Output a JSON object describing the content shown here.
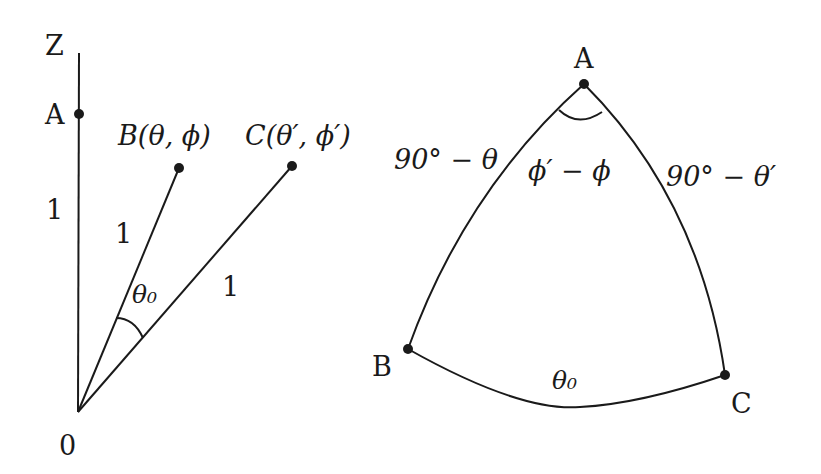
{
  "diagram": {
    "left": {
      "axis_label": "Z",
      "origin_label": "0",
      "point_a_label": "A",
      "point_b_label": "B(θ, ϕ)",
      "point_c_label": "C(θ′, ϕ′)",
      "length_oa": "1",
      "length_ob": "1",
      "length_oc": "1",
      "angle_label": "θ₀"
    },
    "right": {
      "vertex_a_label": "A",
      "vertex_b_label": "B",
      "vertex_c_label": "C",
      "side_ab_label": "90° − θ",
      "side_ac_label": "90° − θ′",
      "angle_a_label": "ϕ′ − ϕ",
      "side_bc_label": "θ₀"
    },
    "colors": {
      "stroke": "#1a1a1a",
      "background": "#ffffff"
    }
  }
}
